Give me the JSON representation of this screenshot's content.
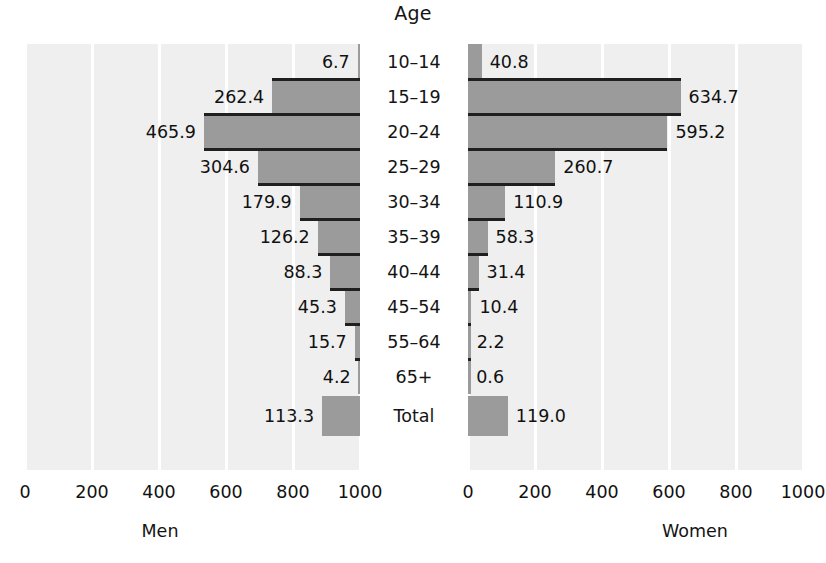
{
  "chart": {
    "title": "Age",
    "left_caption": "Men",
    "right_caption": "Women"
  },
  "axis": {
    "left_ticks": [
      "1000",
      "800",
      "600",
      "400",
      "200",
      "0"
    ],
    "right_ticks": [
      "0",
      "200",
      "400",
      "600",
      "800",
      "1000"
    ]
  },
  "chart_data": {
    "type": "bar",
    "title": "Age",
    "subtitle": "",
    "xlabel": "",
    "ylabel": "Age",
    "orientation": "horizontal",
    "layout": "population-pyramid",
    "categories": [
      "10–14",
      "15–19",
      "20–24",
      "25–29",
      "30–34",
      "35–39",
      "40–44",
      "45–54",
      "55–64",
      "65+",
      "Total"
    ],
    "series": [
      {
        "name": "Men",
        "side": "left",
        "values": [
          6.7,
          262.4,
          465.9,
          304.6,
          179.9,
          126.2,
          88.3,
          45.3,
          15.7,
          4.2,
          113.3
        ],
        "labels": [
          "6.7",
          "262.4",
          "465.9",
          "304.6",
          "179.9",
          "126.2",
          "88.3",
          "45.3",
          "15.7",
          "4.2",
          "113.3"
        ]
      },
      {
        "name": "Women",
        "side": "right",
        "values": [
          40.8,
          634.7,
          595.2,
          260.7,
          110.9,
          58.3,
          31.4,
          10.4,
          2.2,
          0.6,
          119.0
        ],
        "labels": [
          "40.8",
          "634.7",
          "595.2",
          "260.7",
          "110.9",
          "58.3",
          "31.4",
          "10.4",
          "2.2",
          "0.6",
          "119.0"
        ]
      }
    ],
    "xlim_left": [
      1000,
      0
    ],
    "xlim_right": [
      0,
      1000
    ],
    "left_ticks": [
      1000,
      800,
      600,
      400,
      200,
      0
    ],
    "right_ticks": [
      0,
      200,
      400,
      600,
      800,
      1000
    ],
    "grid": true,
    "legend": false,
    "bar_color": "#9b9b9b",
    "panel_background": "#efefef",
    "gridline_color": "#ffffff"
  }
}
